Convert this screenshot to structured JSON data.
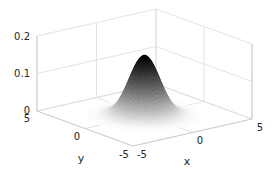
{
  "chart_data": {
    "type": "surface",
    "title": "",
    "function": "z = exp(-(x^2 + y^2) / 2) / (2*pi)",
    "xlabel": "x",
    "ylabel": "y",
    "zlabel": "",
    "xlim": [
      -5,
      5
    ],
    "ylim": [
      -5,
      5
    ],
    "zlim": [
      0,
      0.2
    ],
    "x_ticks": [
      -5,
      0,
      5
    ],
    "y_ticks": [
      -5,
      0,
      5
    ],
    "z_ticks": [
      0,
      0.1,
      0.2
    ],
    "x_tick_labels": [
      "-5",
      "0",
      "5"
    ],
    "y_tick_labels": [
      "-5",
      "0",
      "5"
    ],
    "z_tick_labels": [
      "0",
      "0.1",
      "0.2"
    ],
    "peak": {
      "x": 0,
      "y": 0,
      "z": 0.159
    },
    "colormap": "gray (white at z=0 to black at peak)",
    "grid": true,
    "legend": null,
    "view": "3D perspective, azimuth approx -37.5, elevation approx 30"
  },
  "labels": {
    "x": "x",
    "y": "y",
    "z_ticks": [
      "0",
      "0.1",
      "0.2"
    ],
    "x_ticks": [
      "-5",
      "0",
      "5"
    ],
    "y_ticks": [
      "5",
      "0",
      "-5"
    ]
  },
  "colors": {
    "background": "#ffffff",
    "grid": "#dcdcdc",
    "text": "#262626",
    "surface_low": "#ffffff",
    "surface_high": "#000000"
  }
}
